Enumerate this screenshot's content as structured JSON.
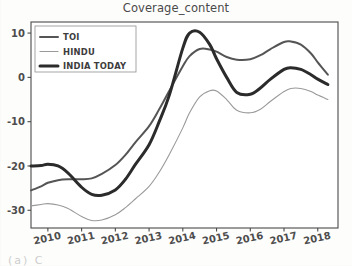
{
  "figure": {
    "title": "Coverage_content",
    "caption_fragment": "(a) C"
  },
  "legend": {
    "position": "upper-left",
    "entries": [
      {
        "label": "TOI",
        "style": "medium",
        "color": "#555555",
        "width": 2.0
      },
      {
        "label": "HINDU",
        "style": "thin",
        "color": "#9a9a9a",
        "width": 1.1
      },
      {
        "label": "INDIA TODAY",
        "style": "thick",
        "color": "#2b2b2b",
        "width": 3.0
      }
    ]
  },
  "axes": {
    "ylabel": "",
    "xlabel": "",
    "yticks": [
      "10",
      "0",
      "-10",
      "-20",
      "-30"
    ],
    "ytick_values": [
      10,
      0,
      -10,
      -20,
      -30
    ],
    "xticks": [
      "2010",
      "2011",
      "2012",
      "2013",
      "2014",
      "2015",
      "2016",
      "2017",
      "2018"
    ],
    "xtick_values": [
      2010,
      2011,
      2012,
      2013,
      2014,
      2015,
      2016,
      2017,
      2018
    ],
    "xlim": [
      2009.5,
      2018.6
    ],
    "ylim": [
      -34.0,
      12.5
    ],
    "xtick_rotation": -12,
    "grid": false
  },
  "chart_data": {
    "type": "line",
    "title": "Coverage_content",
    "xlabel": "",
    "ylabel": "",
    "xlim": [
      2009.5,
      2018.6
    ],
    "ylim": [
      -34.0,
      12.5
    ],
    "grid": false,
    "legend_position": "upper left",
    "x": [
      2009.5,
      2009.8,
      2010.0,
      2010.3,
      2010.6,
      2011.0,
      2011.3,
      2011.6,
      2012.0,
      2012.3,
      2012.6,
      2013.0,
      2013.3,
      2013.6,
      2014.0,
      2014.2,
      2014.5,
      2014.8,
      2015.0,
      2015.3,
      2015.6,
      2016.0,
      2016.3,
      2016.6,
      2017.0,
      2017.2,
      2017.5,
      2017.8,
      2018.0,
      2018.3
    ],
    "series": [
      {
        "name": "TOI",
        "color": "#555555",
        "linewidth": 2.0,
        "values": [
          -25.5,
          -24.6,
          -23.8,
          -23.2,
          -23.0,
          -23.0,
          -22.8,
          -21.8,
          -19.8,
          -17.5,
          -14.6,
          -11.0,
          -7.2,
          -3.0,
          2.5,
          4.8,
          6.4,
          6.3,
          5.8,
          4.6,
          4.0,
          4.1,
          5.0,
          6.4,
          8.0,
          8.1,
          7.4,
          5.4,
          3.4,
          0.6
        ]
      },
      {
        "name": "HINDU",
        "color": "#9a9a9a",
        "linewidth": 1.1,
        "values": [
          -29.0,
          -28.7,
          -28.5,
          -28.8,
          -29.6,
          -31.4,
          -32.3,
          -32.2,
          -31.0,
          -29.4,
          -27.4,
          -24.6,
          -21.4,
          -17.4,
          -11.4,
          -8.0,
          -4.4,
          -3.0,
          -3.1,
          -5.0,
          -7.4,
          -8.0,
          -7.2,
          -5.4,
          -3.2,
          -2.5,
          -2.5,
          -3.2,
          -4.0,
          -5.0
        ]
      },
      {
        "name": "INDIA TODAY",
        "color": "#2b2b2b",
        "linewidth": 3.0,
        "values": [
          -20.0,
          -19.9,
          -19.6,
          -20.0,
          -21.6,
          -24.8,
          -26.4,
          -26.6,
          -25.4,
          -23.0,
          -19.6,
          -15.2,
          -10.0,
          -4.0,
          6.6,
          10.0,
          10.2,
          7.4,
          4.2,
          0.0,
          -3.4,
          -3.8,
          -2.4,
          -0.4,
          1.8,
          2.2,
          1.8,
          0.6,
          -0.4,
          -1.6
        ]
      }
    ]
  }
}
